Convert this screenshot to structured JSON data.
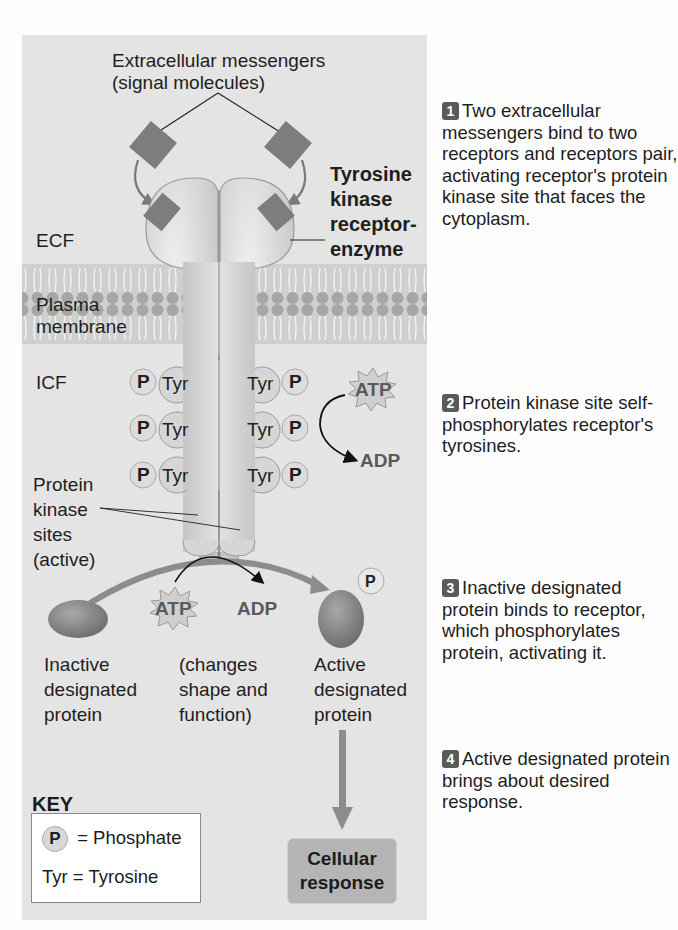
{
  "diagram": {
    "labels": {
      "messengers_line1": "Extracellular messengers",
      "messengers_line2": "(signal molecules)",
      "receptor_line1": "Tyrosine",
      "receptor_line2": "kinase",
      "receptor_line3": "receptor-",
      "receptor_line4": "enzyme",
      "ecf": "ECF",
      "membrane_line1": "Plasma",
      "membrane_line2": "membrane",
      "icf": "ICF",
      "kinase_line1": "Protein",
      "kinase_line2": "kinase",
      "kinase_line3": "sites",
      "kinase_line4": "(active)",
      "inactive_line1": "Inactive",
      "inactive_line2": "designated",
      "inactive_line3": "protein",
      "changes_line1": "(changes",
      "changes_line2": "shape and",
      "changes_line3": "function)",
      "active_line1": "Active",
      "active_line2": "designated",
      "active_line3": "protein",
      "atp": "ATP",
      "adp": "ADP",
      "phosphate": "P",
      "tyr": "Tyr",
      "cellular_response_line1": "Cellular",
      "cellular_response_line2": "response"
    },
    "key": {
      "title": "KEY",
      "phosphate_symbol": "P",
      "phosphate_def": "= Phosphate",
      "tyr_def": "Tyr = Tyrosine"
    },
    "steps": [
      {
        "number": "1",
        "text": "Two extracellular messengers bind to two receptors and receptors pair, activating receptor's protein kinase site that faces the cytoplasm."
      },
      {
        "number": "2",
        "text": "Protein kinase site self-phosphorylates receptor's tyrosines."
      },
      {
        "number": "3",
        "text": "Inactive designated protein binds to receptor, which phosphorylates protein, activating it."
      },
      {
        "number": "4",
        "text": "Active designated protein brings about desired response."
      }
    ],
    "colors": {
      "panel": "#e4e4e4",
      "receptor": "#d2d2d2",
      "messenger": "#7d7d7d",
      "protein": "#8a8a8a",
      "arrow_gray": "#8c8c8c",
      "badge": "#5a5a5a",
      "response_box": "#b5b5b5"
    }
  }
}
